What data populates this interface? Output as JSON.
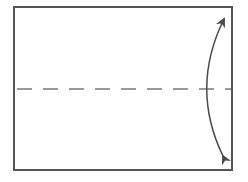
{
  "diagram": {
    "type": "origami-fold-step",
    "colors": {
      "background": "#ffffff",
      "paper_border": "#555555",
      "fold_line": "#7a7a7a",
      "arrow": "#4a4a4a"
    },
    "paper": {
      "shape": "rectangle",
      "x": 14,
      "y": 7,
      "width": 218,
      "height": 163
    },
    "fold_line": {
      "style": "valley-fold-dashed",
      "y": 89,
      "x_start": 17,
      "x_end": 231
    },
    "arrow": {
      "type": "double-headed-curved",
      "meaning": "fold bottom half up / unfold",
      "start": [
        223,
        158
      ],
      "control": [
        190,
        88
      ],
      "end": [
        225,
        17
      ]
    }
  }
}
